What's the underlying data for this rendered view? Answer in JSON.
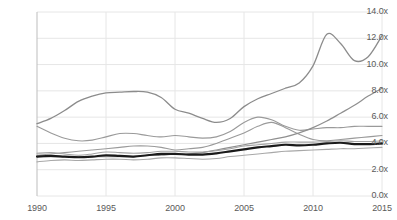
{
  "chart_data": {
    "type": "line",
    "title": "",
    "subtitle": "",
    "xlabel": "",
    "ylabel": "",
    "xlim": [
      1990,
      2015
    ],
    "ylim": [
      0.0,
      14.0
    ],
    "y_ticks": [
      "0.0x",
      "2.0x",
      "4.0x",
      "6.0x",
      "8.0x",
      "10.0x",
      "12.0x",
      "14.0x"
    ],
    "y_tick_values": [
      0,
      2,
      4,
      6,
      8,
      10,
      12,
      14
    ],
    "x_ticks": [
      "1990",
      "1995",
      "2000",
      "2005",
      "2010",
      "2015"
    ],
    "x_tick_values": [
      1990,
      1995,
      2000,
      2005,
      2010,
      2015
    ],
    "grid": "horizontal-and-vertical",
    "legend": "none",
    "x": [
      1990,
      1991,
      1992,
      1993,
      1994,
      1995,
      1996,
      1997,
      1998,
      1999,
      2000,
      2001,
      2002,
      2003,
      2004,
      2005,
      2006,
      2007,
      2008,
      2009,
      2010,
      2011,
      2012,
      2013,
      2014,
      2015
    ],
    "series": [
      {
        "name": "series-rising-peak",
        "color": "#8c8c8c",
        "width": 1.3,
        "values": [
          5.5,
          5.9,
          6.5,
          7.2,
          7.6,
          7.85,
          7.9,
          7.95,
          7.9,
          7.5,
          6.6,
          6.3,
          5.9,
          5.6,
          5.9,
          6.8,
          7.4,
          7.8,
          8.2,
          8.6,
          9.9,
          12.3,
          11.6,
          10.3,
          10.6,
          12.2
        ]
      },
      {
        "name": "series-declining-then-flat",
        "color": "#9a9a9a",
        "width": 1.1,
        "values": [
          5.3,
          4.8,
          4.4,
          4.2,
          4.25,
          4.5,
          4.75,
          4.75,
          4.6,
          4.5,
          4.6,
          4.5,
          4.4,
          4.5,
          4.9,
          5.6,
          6.0,
          5.8,
          5.3,
          5.0,
          5.1,
          5.2,
          5.2,
          5.3,
          5.3,
          5.3
        ]
      },
      {
        "name": "series-low-steady-rise",
        "color": "#9a9a9a",
        "width": 1.1,
        "values": [
          3.1,
          3.2,
          3.3,
          3.4,
          3.5,
          3.6,
          3.7,
          3.8,
          3.8,
          3.7,
          3.5,
          3.6,
          3.7,
          4.0,
          4.4,
          4.8,
          5.3,
          5.6,
          5.2,
          4.7,
          4.3,
          4.2,
          4.3,
          4.4,
          4.5,
          4.6
        ]
      },
      {
        "name": "series-steep-linear-rise",
        "color": "#8f8f8f",
        "width": 1.2,
        "values": [
          3.0,
          3.0,
          3.0,
          3.0,
          3.0,
          3.0,
          3.0,
          3.0,
          3.1,
          3.1,
          3.2,
          3.2,
          3.3,
          3.5,
          3.7,
          3.9,
          4.1,
          4.3,
          4.5,
          4.8,
          5.2,
          5.7,
          6.3,
          6.9,
          7.6,
          8.2
        ]
      },
      {
        "name": "series-flat-mid",
        "color": "#a3a3a3",
        "width": 1.1,
        "values": [
          3.25,
          3.3,
          3.2,
          3.1,
          3.2,
          3.35,
          3.3,
          3.25,
          3.3,
          3.4,
          3.4,
          3.35,
          3.35,
          3.45,
          3.6,
          3.8,
          3.9,
          4.0,
          4.1,
          4.1,
          4.1,
          4.15,
          4.2,
          4.15,
          4.15,
          4.2
        ]
      },
      {
        "name": "series-bold-black-average",
        "color": "#1a1a1a",
        "width": 2.2,
        "values": [
          3.0,
          3.05,
          3.0,
          2.95,
          3.0,
          3.1,
          3.05,
          3.0,
          3.1,
          3.2,
          3.2,
          3.15,
          3.15,
          3.25,
          3.4,
          3.55,
          3.7,
          3.8,
          3.9,
          3.85,
          3.9,
          4.0,
          4.05,
          3.95,
          3.95,
          4.0
        ]
      },
      {
        "name": "series-lowest",
        "color": "#a8a8a8",
        "width": 1.1,
        "values": [
          2.6,
          2.7,
          2.75,
          2.7,
          2.75,
          2.8,
          2.8,
          2.75,
          2.8,
          2.9,
          2.9,
          2.85,
          2.8,
          2.85,
          3.0,
          3.1,
          3.2,
          3.3,
          3.4,
          3.45,
          3.5,
          3.55,
          3.6,
          3.6,
          3.65,
          3.7
        ]
      }
    ],
    "colors": {
      "grid": "#e6e6e6",
      "axis": "#bdbdbd",
      "tick_text": "#5a5a5a",
      "background": "#ffffff",
      "highlight_line": "#1a1a1a"
    }
  }
}
